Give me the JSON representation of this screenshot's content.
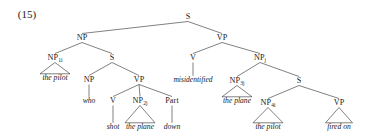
{
  "example_number": "(15)",
  "chart_data": {
    "type": "diagram",
    "title": "(15)",
    "diagram_kind": "syntax-tree",
    "notation": "X-bar phrase structure tree with coindexed NPs",
    "sentence": "the pilot who shot the plane down misidentified the plane the pilot fired on",
    "nodes": [
      {
        "id": "S0",
        "label": "S",
        "sub": "",
        "x": 188,
        "y": 17,
        "kind": "nonterminal"
      },
      {
        "id": "NPa",
        "label": "NP",
        "sub": "",
        "x": 82,
        "y": 38,
        "kind": "nonterminal"
      },
      {
        "id": "VPa",
        "label": "VP",
        "sub": "",
        "x": 222,
        "y": 38,
        "kind": "nonterminal"
      },
      {
        "id": "NP1i",
        "label": "NP",
        "sub": "1i",
        "x": 55,
        "y": 58,
        "kind": "nonterminal"
      },
      {
        "id": "S1",
        "label": "S",
        "sub": "",
        "x": 112,
        "y": 58,
        "kind": "nonterminal"
      },
      {
        "id": "V1",
        "label": "V",
        "sub": "",
        "x": 193,
        "y": 58,
        "kind": "nonterminal"
      },
      {
        "id": "NPj",
        "label": "NP",
        "sub": "j",
        "x": 260,
        "y": 58,
        "kind": "nonterminal"
      },
      {
        "id": "NPwho",
        "label": "NP",
        "sub": "",
        "x": 89,
        "y": 80,
        "kind": "nonterminal"
      },
      {
        "id": "VPb",
        "label": "VP",
        "sub": "",
        "x": 139,
        "y": 80,
        "kind": "nonterminal"
      },
      {
        "id": "NP3j",
        "label": "NP",
        "sub": "3j",
        "x": 237,
        "y": 81,
        "kind": "nonterminal"
      },
      {
        "id": "S2",
        "label": "S",
        "sub": "",
        "x": 299,
        "y": 81,
        "kind": "nonterminal"
      },
      {
        "id": "V2",
        "label": "V",
        "sub": "",
        "x": 113,
        "y": 101,
        "kind": "nonterminal"
      },
      {
        "id": "NP2j",
        "label": "NP",
        "sub": "2j",
        "x": 140,
        "y": 101,
        "kind": "nonterminal"
      },
      {
        "id": "Part",
        "label": "Part",
        "sub": "",
        "x": 172,
        "y": 101,
        "kind": "nonterminal"
      },
      {
        "id": "NP4i",
        "label": "NP",
        "sub": "4i",
        "x": 268,
        "y": 103,
        "kind": "nonterminal"
      },
      {
        "id": "VPc",
        "label": "VP",
        "sub": "",
        "x": 339,
        "y": 103,
        "kind": "nonterminal"
      }
    ],
    "terminals": [
      {
        "id": "t1",
        "text": "the pilot",
        "x": 55,
        "y": 78,
        "parent": "NP1i",
        "triangle": true
      },
      {
        "id": "t2",
        "text": "who",
        "x": 89,
        "y": 101,
        "parent": "NPwho",
        "triangle": false
      },
      {
        "id": "t3",
        "text": "shot",
        "x": 113,
        "y": 127,
        "parent": "V2",
        "triangle": false
      },
      {
        "id": "t4",
        "text": "the plane",
        "x": 140,
        "y": 127,
        "parent": "NP2j",
        "triangle": true
      },
      {
        "id": "t5",
        "text": "down",
        "x": 172,
        "y": 127,
        "parent": "Part",
        "triangle": false
      },
      {
        "id": "t6",
        "text": "misidentified",
        "x": 193,
        "y": 80,
        "parent": "V1",
        "triangle": false
      },
      {
        "id": "t7",
        "text": "the plane",
        "x": 237,
        "y": 101,
        "parent": "NP3j",
        "triangle": true
      },
      {
        "id": "t8",
        "text": "the pilot",
        "x": 268,
        "y": 127,
        "parent": "NP4i",
        "triangle": true
      },
      {
        "id": "t9",
        "text": "fired on",
        "x": 339,
        "y": 127,
        "parent": "VPc",
        "triangle": true
      }
    ],
    "edges": [
      [
        "S0",
        "NPa"
      ],
      [
        "S0",
        "VPa"
      ],
      [
        "NPa",
        "NP1i"
      ],
      [
        "NPa",
        "S1"
      ],
      [
        "VPa",
        "V1"
      ],
      [
        "VPa",
        "NPj"
      ],
      [
        "S1",
        "NPwho"
      ],
      [
        "S1",
        "VPb"
      ],
      [
        "VPb",
        "V2"
      ],
      [
        "VPb",
        "NP2j"
      ],
      [
        "VPb",
        "Part"
      ],
      [
        "NPj",
        "NP3j"
      ],
      [
        "NPj",
        "S2"
      ],
      [
        "S2",
        "NP4i"
      ],
      [
        "S2",
        "VPc"
      ]
    ]
  }
}
